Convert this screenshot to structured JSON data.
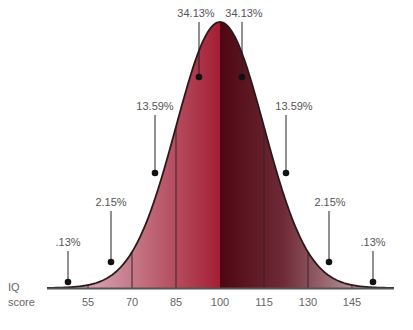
{
  "chart_data": {
    "type": "area",
    "title": "",
    "xlabel": "IQ score",
    "ylabel": "",
    "xlabel_lines": [
      "IQ",
      "score"
    ],
    "mean": 100,
    "sd": 15,
    "categories": [
      "<55",
      "55-70",
      "70-85",
      "85-100",
      "100-115",
      "115-130",
      "130-145",
      ">145"
    ],
    "values": [
      0.13,
      2.15,
      13.59,
      34.13,
      34.13,
      13.59,
      2.15,
      0.13
    ],
    "labels": [
      ".13%",
      "2.15%",
      "13.59%",
      "34.13%",
      "34.13%",
      "13.59%",
      "2.15%",
      ".13%"
    ],
    "tick_labels": [
      "55",
      "70",
      "85",
      "100",
      "115",
      "130",
      "145"
    ],
    "tick_values": [
      55,
      70,
      85,
      100,
      115,
      130,
      145
    ],
    "grid": false,
    "legend": "none",
    "colors": {
      "center_left": "#a41e34",
      "center_right": "#5a0a16",
      "tail": "#e8d0d6",
      "outline": "#2a1a1a",
      "dot": "#111111"
    }
  }
}
